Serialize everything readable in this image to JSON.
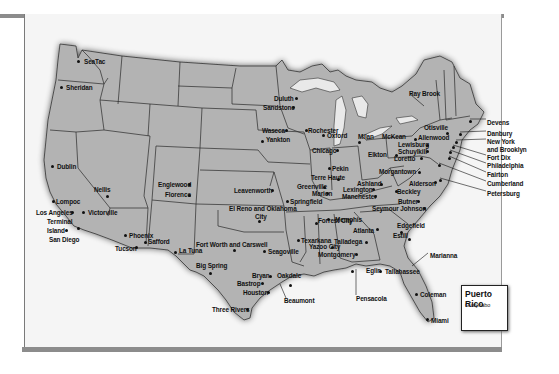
{
  "map": {
    "type": "US federal facilities map",
    "inset": {
      "title": "Puerto Rico",
      "locations": [
        "Guaynabo"
      ]
    },
    "locations": [
      {
        "name": "SeaTac",
        "x": 84,
        "y": 58,
        "dx": 78,
        "dy": 59
      },
      {
        "name": "Sheridan",
        "x": 66,
        "y": 84,
        "dx": 61,
        "dy": 85
      },
      {
        "name": "Dublin",
        "x": 57,
        "y": 163,
        "dx": 52,
        "dy": 164
      },
      {
        "name": "Nellis",
        "x": 94,
        "y": 186,
        "dx": 107,
        "dy": 194
      },
      {
        "name": "Lompoc",
        "x": 56,
        "y": 198,
        "dx": 53,
        "dy": 199
      },
      {
        "name": "Los Angeles",
        "x": 36,
        "y": 209,
        "dx": 72,
        "dy": 210
      },
      {
        "name": "Victorville",
        "x": 88,
        "y": 209,
        "dx": 83,
        "dy": 210
      },
      {
        "name": "Terminal",
        "x": 47,
        "y": 218,
        "dx": 0,
        "dy": 0
      },
      {
        "name": "Island",
        "x": 47,
        "y": 227,
        "dx": 66,
        "dy": 228
      },
      {
        "name": "San Diego",
        "x": 49,
        "y": 236,
        "dx": 78,
        "dy": 226
      },
      {
        "name": "Englewood",
        "x": 158,
        "y": 181,
        "dx": 189,
        "dy": 182
      },
      {
        "name": "Florence",
        "x": 165,
        "y": 191,
        "dx": 189,
        "dy": 193
      },
      {
        "name": "Leavenworth",
        "x": 234,
        "y": 187,
        "dx": 272,
        "dy": 188
      },
      {
        "name": "El Reno and Oklahoma",
        "x": 229,
        "y": 205,
        "dx": 0,
        "dy": 0
      },
      {
        "name": "City",
        "x": 255,
        "y": 213,
        "dx": 259,
        "dy": 219
      },
      {
        "name": "Phoenix",
        "x": 129,
        "y": 232,
        "dx": 125,
        "dy": 233
      },
      {
        "name": "Safford",
        "x": 148,
        "y": 238,
        "dx": 145,
        "dy": 240
      },
      {
        "name": "Tucson",
        "x": 115,
        "y": 245,
        "dx": 136,
        "dy": 245
      },
      {
        "name": "La Tuna",
        "x": 179,
        "y": 247,
        "dx": 175,
        "dy": 250
      },
      {
        "name": "Fort Worth and Carswell",
        "x": 196,
        "y": 241,
        "dx": 234,
        "dy": 248
      },
      {
        "name": "Seagoville",
        "x": 268,
        "y": 248,
        "dx": 264,
        "dy": 249
      },
      {
        "name": "Big Spring",
        "x": 196,
        "y": 262,
        "dx": 210,
        "dy": 271
      },
      {
        "name": "Bryan",
        "x": 252,
        "y": 272,
        "dx": 270,
        "dy": 274
      },
      {
        "name": "Oakdale",
        "x": 277,
        "y": 272,
        "dx": 290,
        "dy": 283
      },
      {
        "name": "Bastrop",
        "x": 237,
        "y": 280,
        "dx": 262,
        "dy": 281
      },
      {
        "name": "Houston",
        "x": 243,
        "y": 289,
        "dx": 268,
        "dy": 290
      },
      {
        "name": "Beaumont",
        "x": 284,
        "y": 297,
        "dx": 0,
        "dy": 0
      },
      {
        "name": "Three Rivers",
        "x": 212,
        "y": 306,
        "dx": 247,
        "dy": 307
      },
      {
        "name": "Duluth",
        "x": 274,
        "y": 95,
        "dx": 296,
        "dy": 96
      },
      {
        "name": "Sandstone",
        "x": 263,
        "y": 104,
        "dx": 293,
        "dy": 105
      },
      {
        "name": "Waseca",
        "x": 262,
        "y": 127,
        "dx": 286,
        "dy": 128
      },
      {
        "name": "Rochester",
        "x": 308,
        "y": 127,
        "dx": 306,
        "dy": 128
      },
      {
        "name": "Oxford",
        "x": 327,
        "y": 132,
        "dx": 323,
        "dy": 133
      },
      {
        "name": "Yankton",
        "x": 266,
        "y": 136,
        "dx": 262,
        "dy": 139
      },
      {
        "name": "Milan",
        "x": 358,
        "y": 133,
        "dx": 359,
        "dy": 140
      },
      {
        "name": "Chicago",
        "x": 312,
        "y": 147,
        "dx": 337,
        "dy": 148
      },
      {
        "name": "Pekin",
        "x": 332,
        "y": 165,
        "dx": 329,
        "dy": 166
      },
      {
        "name": "Terre Haute",
        "x": 311,
        "y": 174,
        "dx": 338,
        "dy": 177
      },
      {
        "name": "Greenville",
        "x": 297,
        "y": 183,
        "dx": 324,
        "dy": 185
      },
      {
        "name": "Marion",
        "x": 312,
        "y": 190,
        "dx": 327,
        "dy": 191
      },
      {
        "name": "Springfield",
        "x": 290,
        "y": 198,
        "dx": 287,
        "dy": 199
      },
      {
        "name": "Ashland",
        "x": 357,
        "y": 180,
        "dx": 381,
        "dy": 182
      },
      {
        "name": "Lexington",
        "x": 343,
        "y": 186,
        "dx": 373,
        "dy": 187
      },
      {
        "name": "Manchester",
        "x": 342,
        "y": 193,
        "dx": 375,
        "dy": 194
      },
      {
        "name": "Elkton",
        "x": 368,
        "y": 151,
        "dx": 396,
        "dy": 153
      },
      {
        "name": "Morgantown",
        "x": 379,
        "y": 168,
        "dx": 419,
        "dy": 170
      },
      {
        "name": "Alderson",
        "x": 409,
        "y": 180,
        "dx": 435,
        "dy": 180
      },
      {
        "name": "Beckley",
        "x": 397,
        "y": 188,
        "dx": 396,
        "dy": 189
      },
      {
        "name": "Butner",
        "x": 398,
        "y": 198,
        "dx": 418,
        "dy": 199
      },
      {
        "name": "Seymour Johnson",
        "x": 372,
        "y": 205,
        "dx": 424,
        "dy": 206
      },
      {
        "name": "Edgefield",
        "x": 397,
        "y": 222,
        "dx": 401,
        "dy": 230
      },
      {
        "name": "Estill",
        "x": 393,
        "y": 232,
        "dx": 409,
        "dy": 237
      },
      {
        "name": "Forrest City",
        "x": 318,
        "y": 217,
        "dx": 316,
        "dy": 221
      },
      {
        "name": "Memphis",
        "x": 335,
        "y": 216,
        "dx": 328,
        "dy": 217
      },
      {
        "name": "Atlanta",
        "x": 353,
        "y": 227,
        "dx": 377,
        "dy": 227
      },
      {
        "name": "Texarkana",
        "x": 301,
        "y": 237,
        "dx": 298,
        "dy": 238
      },
      {
        "name": "Yazoo City",
        "x": 309,
        "y": 243,
        "dx": 332,
        "dy": 245
      },
      {
        "name": "Talladega",
        "x": 334,
        "y": 238,
        "dx": 366,
        "dy": 240
      },
      {
        "name": "Montgomery",
        "x": 318,
        "y": 251,
        "dx": 356,
        "dy": 252
      },
      {
        "name": "Eglin",
        "x": 366,
        "y": 267,
        "dx": 352,
        "dy": 269
      },
      {
        "name": "Tallahassee",
        "x": 385,
        "y": 268,
        "dx": 380,
        "dy": 269
      },
      {
        "name": "Pensacola",
        "x": 356,
        "y": 295,
        "dx": 0,
        "dy": 0
      },
      {
        "name": "Marianna",
        "x": 430,
        "y": 252,
        "dx": 0,
        "dy": 0
      },
      {
        "name": "Coleman",
        "x": 420,
        "y": 291,
        "dx": 416,
        "dy": 292
      },
      {
        "name": "Miami",
        "x": 431,
        "y": 317,
        "dx": 427,
        "dy": 317
      },
      {
        "name": "Ray Brook",
        "x": 409,
        "y": 90,
        "dx": 0,
        "dy": 0
      },
      {
        "name": "Otisville",
        "x": 424,
        "y": 124,
        "dx": 447,
        "dy": 131
      },
      {
        "name": "McKean",
        "x": 382,
        "y": 133,
        "dx": 0,
        "dy": 0
      },
      {
        "name": "Allenwood",
        "x": 418,
        "y": 134,
        "dx": 415,
        "dy": 137
      },
      {
        "name": "Lewisburg",
        "x": 398,
        "y": 141,
        "dx": 427,
        "dy": 143
      },
      {
        "name": "Schuylkill",
        "x": 398,
        "y": 148,
        "dx": 427,
        "dy": 149
      },
      {
        "name": "Loretto",
        "x": 394,
        "y": 155,
        "dx": 421,
        "dy": 156
      },
      {
        "name": "Devens",
        "x": 487,
        "y": 119,
        "dx": 470,
        "dy": 119
      },
      {
        "name": "Danbury",
        "x": 487,
        "y": 130,
        "dx": 460,
        "dy": 132
      },
      {
        "name": "New York",
        "x": 487,
        "y": 138,
        "dx": 0,
        "dy": 0
      },
      {
        "name": "and Brooklyn",
        "x": 487,
        "y": 146,
        "dx": 456,
        "dy": 140
      },
      {
        "name": "Fort Dix",
        "x": 487,
        "y": 154,
        "dx": 453,
        "dy": 145
      },
      {
        "name": "Philadelphia",
        "x": 487,
        "y": 162,
        "dx": 450,
        "dy": 150
      },
      {
        "name": "Fairton",
        "x": 487,
        "y": 171,
        "dx": 449,
        "dy": 156
      },
      {
        "name": "Cumberland",
        "x": 487,
        "y": 180,
        "dx": 439,
        "dy": 163
      },
      {
        "name": "Petersburg",
        "x": 487,
        "y": 190,
        "dx": 440,
        "dy": 178
      }
    ]
  }
}
